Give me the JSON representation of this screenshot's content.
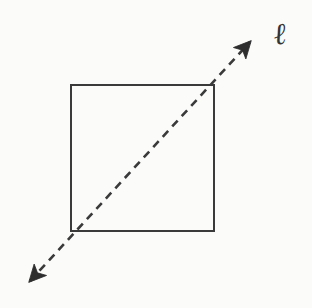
{
  "figure": {
    "kind": "geometry-diagram",
    "background_color": "#fbfbfa",
    "ink_color": "#343434",
    "width": 312,
    "height": 308
  },
  "square": {
    "name": "square",
    "stroke_color": "#3a3a3a",
    "stroke_width": 2.2,
    "fill": "none",
    "left": 71,
    "top": 85,
    "right": 214,
    "bottom": 231,
    "corners": {
      "top_left": [
        71,
        85
      ],
      "top_right": [
        214,
        85
      ],
      "bottom_right": [
        214,
        231
      ],
      "bottom_left": [
        71,
        231
      ]
    }
  },
  "line": {
    "name": "line-ell",
    "label": "ℓ",
    "style": "dashed",
    "stroke_color": "#3a3a3a",
    "stroke_width": 2.6,
    "dash_pattern": "8 6",
    "arrowheads": "both",
    "start_point": [
      30,
      281
    ],
    "end_point": [
      250,
      42
    ],
    "passes_through": [
      [
        71,
        231
      ],
      [
        214,
        85
      ]
    ]
  },
  "arrowheads": {
    "upper_right": {
      "name": "arrowhead-upper-right",
      "tip": [
        254,
        37
      ],
      "fill": "#2e2e2e"
    },
    "lower_left": {
      "name": "arrowhead-lower-left",
      "tip": [
        25,
        286
      ],
      "fill": "#2e2e2e"
    }
  },
  "labels": {
    "ell": {
      "text": "ℓ",
      "x": 276,
      "y": 22,
      "font_size": 30,
      "color": "#343434"
    }
  }
}
